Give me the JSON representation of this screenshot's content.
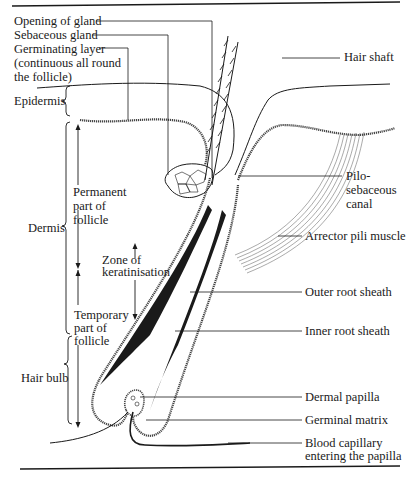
{
  "figure": {
    "colors": {
      "ink": "#1a1a1a",
      "background": "#ffffff"
    }
  },
  "labels": {
    "left": {
      "opening_of_gland": "Opening of gland",
      "sebaceous_gland": "Sebaceous gland",
      "germinating_layer": [
        "Germinating layer",
        "(continuous all round",
        "the follicle)"
      ],
      "epidermis": "Epidermis",
      "permanent_part": [
        "Permanent",
        "part of",
        "follicle"
      ],
      "dermis": "Dermis",
      "zone_of_keratinisation": [
        "Zone of",
        "keratinisation"
      ],
      "temporary_part": [
        "Temporary",
        "part of",
        "follicle"
      ],
      "hair_bulb": "Hair bulb"
    },
    "right": {
      "hair_shaft": "Hair shaft",
      "pilosebaceous_canal": [
        "Pilo-",
        "sebaceous",
        "canal"
      ],
      "arrector_pili_muscle": "Arrector pili muscle",
      "outer_root_sheath": "Outer root sheath",
      "inner_root_sheath": "Inner root sheath",
      "dermal_papilla": "Dermal papilla",
      "germinal_matrix": "Germinal matrix",
      "blood_capillary": [
        "Blood capillary",
        "entering the papilla"
      ]
    }
  }
}
